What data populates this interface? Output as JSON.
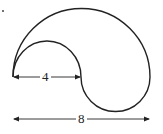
{
  "diagram": {
    "labels": {
      "inner_width": "4",
      "outer_width": "8"
    },
    "stroke_color": "#222222"
  }
}
